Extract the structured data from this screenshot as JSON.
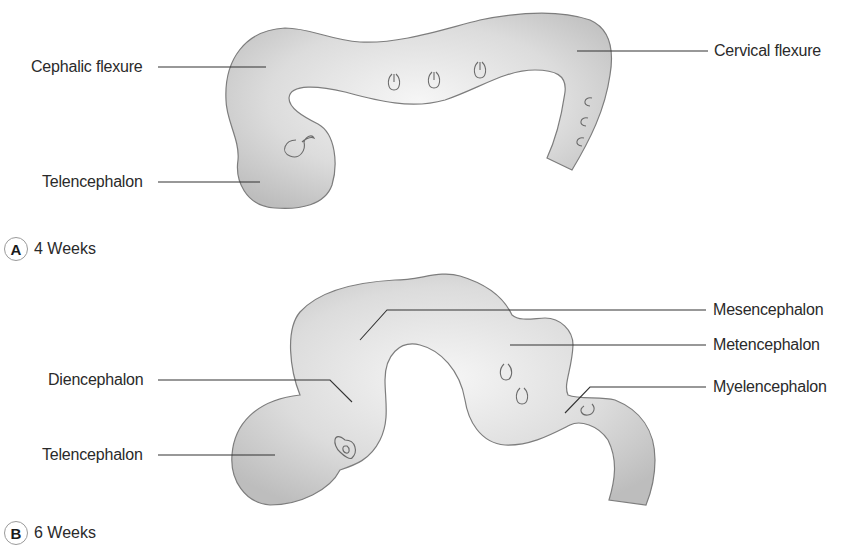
{
  "figure": {
    "panels": [
      {
        "letter": "A",
        "caption": "4 Weeks",
        "labels": {
          "cephalic_flexure": "Cephalic flexure",
          "telencephalon": "Telencephalon",
          "cervical_flexure": "Cervical flexure"
        }
      },
      {
        "letter": "B",
        "caption": "6 Weeks",
        "labels": {
          "diencephalon": "Diencephalon",
          "telencephalon": "Telencephalon",
          "mesencephalon": "Mesencephalon",
          "metencephalon": "Metencephalon",
          "myelencephalon": "Myelencephalon"
        }
      }
    ],
    "colors": {
      "tissue_light": "#f4f4f4",
      "tissue_dark": "#bdbdbd",
      "outline": "#7d7d7d",
      "text": "#2a2a2a"
    }
  }
}
